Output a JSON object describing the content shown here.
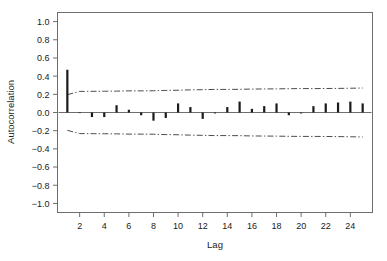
{
  "chart_data": {
    "type": "bar",
    "title": "",
    "subtitle": "",
    "xlabel": "Lag",
    "ylabel": "Autocorrelation",
    "xlim": [
      0.2,
      25.8
    ],
    "ylim": [
      -1.1,
      1.1
    ],
    "grid": false,
    "legend": null,
    "x": [
      1,
      2,
      3,
      4,
      5,
      6,
      7,
      8,
      9,
      10,
      11,
      12,
      13,
      14,
      15,
      16,
      17,
      18,
      19,
      20,
      21,
      22,
      23,
      24,
      25
    ],
    "values": [
      0.47,
      0.0,
      -0.05,
      -0.05,
      0.08,
      0.03,
      -0.03,
      -0.09,
      -0.06,
      0.1,
      0.06,
      -0.07,
      -0.01,
      0.06,
      0.12,
      0.04,
      0.07,
      0.1,
      -0.03,
      -0.01,
      0.07,
      0.1,
      0.11,
      0.12,
      0.1
    ],
    "xticks": [
      2,
      4,
      6,
      8,
      10,
      12,
      14,
      16,
      18,
      20,
      22,
      24
    ],
    "xticklabels": [
      "2",
      "4",
      "6",
      "8",
      "10",
      "12",
      "14",
      "16",
      "18",
      "20",
      "22",
      "24"
    ],
    "yticks": [
      1.0,
      0.8,
      0.6,
      0.4,
      0.2,
      0.0,
      -0.2,
      -0.4,
      -0.6,
      -0.8,
      -1.0
    ],
    "yticklabels": [
      "1.0",
      "0.8",
      "0.6",
      "0.4",
      "0.2",
      "0.0",
      "−0.2",
      "−0.4",
      "−0.6",
      "−0.8",
      "−1.0"
    ],
    "confidence_band": {
      "style": "dash-dot",
      "upper": [
        0.196,
        0.232,
        0.233,
        0.234,
        0.235,
        0.238,
        0.238,
        0.239,
        0.243,
        0.245,
        0.249,
        0.251,
        0.254,
        0.254,
        0.255,
        0.258,
        0.259,
        0.26,
        0.262,
        0.263,
        0.263,
        0.264,
        0.265,
        0.267,
        0.269
      ],
      "lower": [
        -0.196,
        -0.232,
        -0.233,
        -0.234,
        -0.235,
        -0.238,
        -0.238,
        -0.239,
        -0.243,
        -0.245,
        -0.249,
        -0.251,
        -0.254,
        -0.254,
        -0.255,
        -0.258,
        -0.259,
        -0.26,
        -0.262,
        -0.263,
        -0.263,
        -0.264,
        -0.265,
        -0.267,
        -0.269
      ]
    },
    "colors": {
      "bar": "#1a1a1a",
      "axis": "#6e6e6e",
      "zero_line": "#6e6e6e",
      "band": "#4d4d4d",
      "background": "#ffffff"
    }
  }
}
